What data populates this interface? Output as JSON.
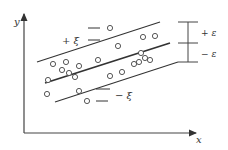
{
  "diagram": {
    "type": "svr-epsilon-tube",
    "axes": {
      "x_label": "x",
      "y_label": "y"
    },
    "lines": [
      {
        "name": "upper-boundary",
        "label": "+ξ",
        "x1": 37,
        "y1": 62,
        "x2": 160,
        "y2": 22,
        "width": 1.1
      },
      {
        "name": "regression-line",
        "label": "",
        "x1": 45,
        "y1": 83,
        "x2": 170,
        "y2": 43,
        "width": 1.8
      },
      {
        "name": "lower-boundary",
        "label": "−ξ",
        "x1": 55,
        "y1": 102,
        "x2": 178,
        "y2": 62,
        "width": 1.1
      }
    ],
    "labels": {
      "plus_xi": "+ ξ",
      "minus_xi": "− ξ",
      "plus_epsilon": "+ ε",
      "minus_epsilon": "− ε"
    },
    "points": [
      [
        110,
        28
      ],
      [
        155,
        36
      ],
      [
        143,
        37
      ],
      [
        118,
        46
      ],
      [
        141,
        53
      ],
      [
        53,
        64
      ],
      [
        66,
        62
      ],
      [
        79,
        66
      ],
      [
        98,
        60
      ],
      [
        145,
        58
      ],
      [
        139,
        62
      ],
      [
        150,
        60
      ],
      [
        62,
        70
      ],
      [
        69,
        73
      ],
      [
        75,
        77
      ],
      [
        48,
        80
      ],
      [
        110,
        76
      ],
      [
        122,
        72
      ],
      [
        134,
        64
      ],
      [
        47,
        94
      ],
      [
        79,
        91
      ],
      [
        87,
        101
      ]
    ],
    "colors": {
      "ink": "#333333",
      "background": "#ffffff"
    }
  }
}
